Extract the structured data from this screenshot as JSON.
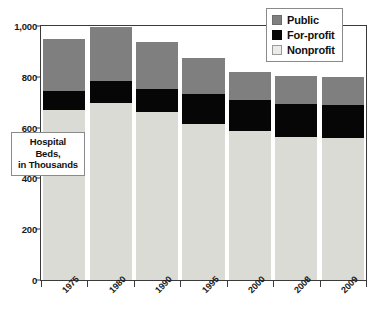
{
  "chart_data": {
    "type": "bar",
    "subtype": "stacked-bar",
    "title": "",
    "xlabel": "",
    "ylabel": "Hospital Beds, in Thousands",
    "ylabel_lines": [
      "Hospital",
      "Beds,",
      "in Thousands"
    ],
    "categories": [
      "1975",
      "1980",
      "1990",
      "1995",
      "2000",
      "2008",
      "2009"
    ],
    "series": [
      {
        "name": "Nonprofit",
        "color": "#dbdbd6",
        "values": [
          668,
          695,
          660,
          613,
          586,
          563,
          559
        ]
      },
      {
        "name": "For-profit",
        "color": "#060606",
        "values": [
          78,
          90,
          93,
          121,
          121,
          129,
          129
        ]
      },
      {
        "name": "Public",
        "color": "#7f7f7f",
        "values": [
          202,
          210,
          183,
          140,
          113,
          113,
          112
        ]
      }
    ],
    "totals": [
      948,
      995,
      936,
      874,
      820,
      805,
      800
    ],
    "ylim": [
      0,
      1000
    ],
    "yticks": [
      0,
      200,
      400,
      600,
      800,
      1000
    ],
    "ytick_labels": [
      "0",
      "200",
      "400",
      "600",
      "800",
      "1,000"
    ],
    "grid": false,
    "legend_position": "top-right",
    "stack_order_bottom_to_top": [
      "Nonprofit",
      "For-profit",
      "Public"
    ]
  },
  "legend": {
    "items": [
      {
        "label": "Public",
        "swatch": "public-swatch"
      },
      {
        "label": "For-profit",
        "swatch": "forprofit-swatch"
      },
      {
        "label": "Nonprofit",
        "swatch": "nonprofit-swatch"
      }
    ]
  }
}
